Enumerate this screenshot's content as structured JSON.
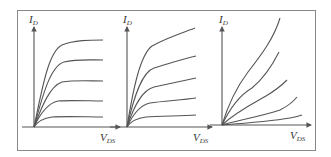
{
  "figure": {
    "frame_color": "#888888",
    "line_color": "#555555",
    "panels": [
      {
        "id": "panel-1",
        "y_label": {
          "main": "I",
          "sub": "D"
        },
        "x_label": {
          "main": "V",
          "sub": "DS"
        },
        "curve_family": "saturating",
        "curve_count": 5
      },
      {
        "id": "panel-2",
        "y_label": {
          "main": "I",
          "sub": "D"
        },
        "x_label": {
          "main": "V",
          "sub": "DS"
        },
        "curve_family": "saturating-with-slope",
        "curve_count": 5
      },
      {
        "id": "panel-3",
        "y_label": {
          "main": "I",
          "sub": "D"
        },
        "x_label": {
          "main": "V",
          "sub": "DS"
        },
        "curve_family": "non-saturating",
        "curve_count": 5
      }
    ]
  }
}
